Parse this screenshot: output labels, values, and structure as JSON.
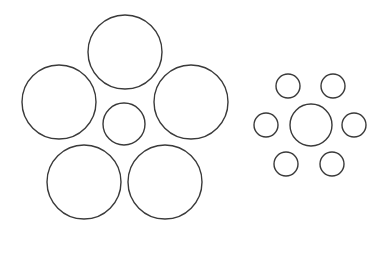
{
  "figure": {
    "title": "",
    "stroke_color": "#3a3a3a",
    "background": "#ffffff",
    "left_group": {
      "center": {
        "cx": 124,
        "cy": 124,
        "r": 21
      },
      "surrounding": [
        {
          "cx": 125,
          "cy": 52,
          "r": 37
        },
        {
          "cx": 59,
          "cy": 102,
          "r": 37
        },
        {
          "cx": 191,
          "cy": 102,
          "r": 37
        },
        {
          "cx": 84,
          "cy": 182,
          "r": 37
        },
        {
          "cx": 165,
          "cy": 182,
          "r": 37
        }
      ]
    },
    "right_group": {
      "center": {
        "cx": 311,
        "cy": 125,
        "r": 21
      },
      "surrounding": [
        {
          "cx": 288,
          "cy": 86,
          "r": 12
        },
        {
          "cx": 333,
          "cy": 86,
          "r": 12
        },
        {
          "cx": 266,
          "cy": 125,
          "r": 12
        },
        {
          "cx": 354,
          "cy": 125,
          "r": 12
        },
        {
          "cx": 286,
          "cy": 164,
          "r": 12
        },
        {
          "cx": 332,
          "cy": 164,
          "r": 12
        }
      ]
    }
  }
}
